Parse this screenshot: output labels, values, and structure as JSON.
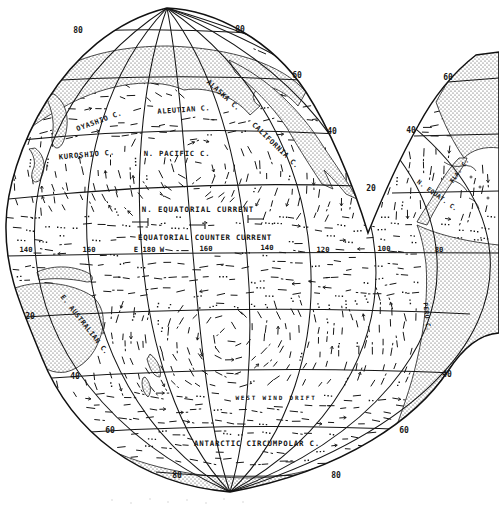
{
  "colors": {
    "ink": "#161616",
    "paper": "#ffffff"
  },
  "labels": {
    "currents": [
      {
        "text": "OYASHIO C.",
        "x": 100,
        "y": 123,
        "rot": -20,
        "fs": 7.0,
        "ls": 0.6
      },
      {
        "text": "ALEUTIAN C.",
        "x": 184,
        "y": 112,
        "rot": -4,
        "fs": 7.0,
        "ls": 0.6
      },
      {
        "text": "ALASKA C.",
        "x": 222,
        "y": 97,
        "rot": 42,
        "fs": 7.0,
        "ls": 0.5
      },
      {
        "text": "KUROSHIO C.",
        "x": 87,
        "y": 157,
        "rot": -5,
        "fs": 7.2,
        "ls": 0.8
      },
      {
        "text": "N. PACIFIC C.",
        "x": 177,
        "y": 156,
        "rot": 0,
        "fs": 7.2,
        "ls": 0.8
      },
      {
        "text": "CALIFORNIA C.",
        "x": 274,
        "y": 147,
        "rot": 44,
        "fs": 7.0,
        "ls": 0.6
      },
      {
        "text": "N. EQUATORIAL CURRENT",
        "x": 198,
        "y": 212,
        "rot": 0,
        "fs": 7.4,
        "ls": 0.9
      },
      {
        "text": "EQUATORIAL COUNTER CURRENT",
        "x": 205,
        "y": 240,
        "rot": 0,
        "fs": 7.4,
        "ls": 0.7
      },
      {
        "text": "E. AUSTRALIAN C.",
        "x": 83,
        "y": 326,
        "rot": 52,
        "fs": 6.8,
        "ls": 0.5
      },
      {
        "text": "PERU C.",
        "x": 425,
        "y": 317,
        "rot": 83,
        "fs": 6.2,
        "ls": 0.4
      },
      {
        "text": "WEST WIND DRIFT",
        "x": 276,
        "y": 400,
        "rot": 0,
        "fs": 6.0,
        "ls": 1.8
      },
      {
        "text": "ANTARCTIC CIRCUMPOLAR C.",
        "x": 257,
        "y": 446,
        "rot": 0,
        "fs": 7.4,
        "ls": 0.8
      },
      {
        "text": "N. EQUAT. C.",
        "x": 436,
        "y": 197,
        "rot": 36,
        "fs": 6.2,
        "ls": 0.3
      },
      {
        "text": "FLA. C.",
        "x": 461,
        "y": 172,
        "rot": -55,
        "fs": 6.2,
        "ls": 0.3
      }
    ],
    "latitudes": [
      {
        "text": "80",
        "x": 78,
        "y": 33
      },
      {
        "text": "80",
        "x": 240,
        "y": 32
      },
      {
        "text": "60",
        "x": 297,
        "y": 78
      },
      {
        "text": "60",
        "x": 448,
        "y": 80
      },
      {
        "text": "40",
        "x": 332,
        "y": 134
      },
      {
        "text": "40",
        "x": 411,
        "y": 133
      },
      {
        "text": "20",
        "x": 371,
        "y": 191
      },
      {
        "text": "20",
        "x": 30,
        "y": 319
      },
      {
        "text": "40",
        "x": 75,
        "y": 379
      },
      {
        "text": "60",
        "x": 110,
        "y": 433
      },
      {
        "text": "40",
        "x": 447,
        "y": 377
      },
      {
        "text": "60",
        "x": 404,
        "y": 433
      },
      {
        "text": "80",
        "x": 177,
        "y": 478
      },
      {
        "text": "80",
        "x": 336,
        "y": 478
      }
    ],
    "longitudes": [
      {
        "text": "140",
        "x": 26,
        "y": 252
      },
      {
        "text": "160",
        "x": 89,
        "y": 252
      },
      {
        "text": "E 180 W",
        "x": 149,
        "y": 252
      },
      {
        "text": "160",
        "x": 206,
        "y": 251
      },
      {
        "text": "140",
        "x": 267,
        "y": 250
      },
      {
        "text": "120",
        "x": 323,
        "y": 252
      },
      {
        "text": "100",
        "x": 384,
        "y": 251
      },
      {
        "text": "80",
        "x": 439,
        "y": 252
      }
    ]
  }
}
